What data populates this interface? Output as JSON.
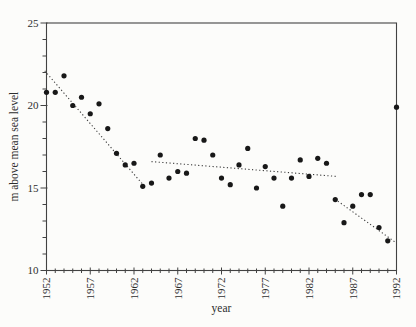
{
  "figure": {
    "background": "#fcfcfa",
    "frame_color": "#424242",
    "tick_color": "#424242",
    "text_color": "#2e2e2e",
    "point_color": "#181818",
    "trend_color": "#3c3c3c"
  },
  "chart_data": {
    "type": "scatter",
    "title": "",
    "xlabel": "year",
    "ylabel": "m above mean sea level",
    "xlim": [
      1952,
      1992
    ],
    "ylim": [
      10,
      25
    ],
    "grid": false,
    "legend": null,
    "x_major_ticks": [
      1952,
      1957,
      1962,
      1967,
      1972,
      1977,
      1982,
      1987,
      1992
    ],
    "x_tick_labels": [
      "1952",
      "1957",
      "1962",
      "1967",
      "1972",
      "1977",
      "1982",
      "1987",
      "1992"
    ],
    "x_minor_step": 1,
    "y_major_ticks": [
      10,
      15,
      20,
      25
    ],
    "y_tick_labels": [
      "10",
      "15",
      "20",
      "25"
    ],
    "y_minor_step": 1,
    "marker": {
      "shape": "filled-circle",
      "radius_px": 2.6
    },
    "series": [
      {
        "name": "annual level",
        "x": [
          1952,
          1953,
          1954,
          1955,
          1956,
          1957,
          1958,
          1959,
          1960,
          1961,
          1962,
          1963,
          1964,
          1965,
          1966,
          1967,
          1968,
          1969,
          1970,
          1971,
          1972,
          1973,
          1974,
          1975,
          1976,
          1977,
          1978,
          1979,
          1980,
          1981,
          1982,
          1983,
          1984,
          1985,
          1986,
          1987,
          1988,
          1989,
          1990,
          1991,
          1992
        ],
        "y": [
          20.8,
          20.8,
          21.8,
          20.0,
          20.5,
          19.5,
          20.1,
          18.6,
          17.1,
          16.4,
          16.5,
          15.1,
          15.3,
          17.0,
          15.6,
          16.0,
          15.9,
          18.0,
          17.9,
          17.0,
          15.6,
          15.2,
          16.4,
          17.4,
          15.0,
          16.3,
          15.6,
          13.9,
          15.6,
          16.7,
          15.7,
          16.8,
          16.5,
          14.3,
          12.9,
          13.9,
          14.6,
          14.6,
          12.6,
          11.8,
          19.9
        ]
      }
    ],
    "trend_lines": [
      {
        "style": "dotted",
        "x1": 1951.8,
        "y1": 22.1,
        "x2": 1963.2,
        "y2": 15.1
      },
      {
        "style": "dotted",
        "x1": 1964.0,
        "y1": 16.6,
        "x2": 1985.2,
        "y2": 15.7
      },
      {
        "style": "dotted",
        "x1": 1985.3,
        "y1": 14.2,
        "x2": 1991.9,
        "y2": 11.7
      }
    ]
  }
}
